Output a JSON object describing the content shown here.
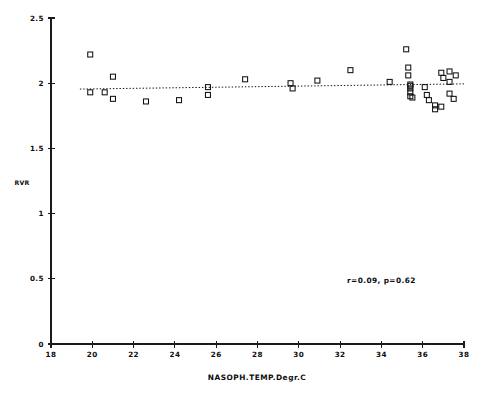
{
  "chart_data": {
    "type": "scatter",
    "title": "",
    "xlabel": "NASOPH.TEMP.Degr.C",
    "ylabel": "RVR",
    "xlim": [
      18,
      38
    ],
    "ylim": [
      0,
      2.5
    ],
    "xticks": [
      18,
      20,
      22,
      24,
      26,
      28,
      30,
      32,
      34,
      36,
      38
    ],
    "xtick_labels": [
      "18",
      "20",
      "22",
      "24",
      "26",
      "28",
      "30",
      "32",
      "34",
      "36",
      "38"
    ],
    "yticks": [
      0,
      0.5,
      1,
      1.5,
      2,
      2.5
    ],
    "ytick_labels": [
      "0",
      "0.5",
      "1",
      "1.5",
      "2",
      "2.5"
    ],
    "grid": false,
    "legend": "none",
    "marker": "open-square",
    "marker_color": "#111111",
    "annotations": [
      {
        "name": "correlation-annotation",
        "text": "r=0.09, p=0.62",
        "x": 34.0,
        "y": 0.47
      }
    ],
    "fit_line": {
      "name": "regression-line",
      "style": "dotted",
      "x_start": 19.4,
      "x_end": 38.0,
      "y_start": 1.955,
      "y_end": 1.995
    },
    "points": [
      {
        "x": 19.9,
        "y": 2.22
      },
      {
        "x": 19.9,
        "y": 1.93
      },
      {
        "x": 20.6,
        "y": 1.93
      },
      {
        "x": 21.0,
        "y": 2.05
      },
      {
        "x": 21.0,
        "y": 1.88
      },
      {
        "x": 22.6,
        "y": 1.86
      },
      {
        "x": 24.2,
        "y": 1.87
      },
      {
        "x": 25.6,
        "y": 1.97
      },
      {
        "x": 25.6,
        "y": 1.91
      },
      {
        "x": 27.4,
        "y": 2.03
      },
      {
        "x": 29.6,
        "y": 2.0
      },
      {
        "x": 29.7,
        "y": 1.96
      },
      {
        "x": 30.9,
        "y": 2.02
      },
      {
        "x": 32.5,
        "y": 2.1
      },
      {
        "x": 34.4,
        "y": 2.01
      },
      {
        "x": 35.2,
        "y": 2.26
      },
      {
        "x": 35.3,
        "y": 2.12
      },
      {
        "x": 35.3,
        "y": 2.06
      },
      {
        "x": 35.4,
        "y": 1.99
      },
      {
        "x": 35.4,
        "y": 1.98
      },
      {
        "x": 35.4,
        "y": 1.96
      },
      {
        "x": 35.4,
        "y": 1.93
      },
      {
        "x": 35.4,
        "y": 1.9
      },
      {
        "x": 35.5,
        "y": 1.89
      },
      {
        "x": 36.1,
        "y": 1.97
      },
      {
        "x": 36.2,
        "y": 1.91
      },
      {
        "x": 36.3,
        "y": 1.87
      },
      {
        "x": 36.6,
        "y": 1.83
      },
      {
        "x": 36.6,
        "y": 1.8
      },
      {
        "x": 36.9,
        "y": 1.82
      },
      {
        "x": 36.9,
        "y": 2.08
      },
      {
        "x": 37.0,
        "y": 2.04
      },
      {
        "x": 37.3,
        "y": 2.09
      },
      {
        "x": 37.3,
        "y": 2.01
      },
      {
        "x": 37.3,
        "y": 1.92
      },
      {
        "x": 37.5,
        "y": 1.88
      },
      {
        "x": 37.6,
        "y": 2.06
      }
    ]
  },
  "plot_geometry": {
    "x_axis_px": {
      "left": 51,
      "right": 464,
      "y": 344
    },
    "y_axis_px": {
      "x": 51,
      "top": 18,
      "bottom": 344
    },
    "x_domain": [
      18,
      38
    ],
    "y_domain": [
      0,
      2.5
    ]
  }
}
